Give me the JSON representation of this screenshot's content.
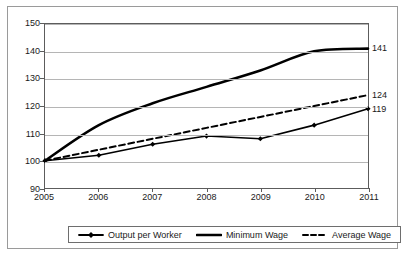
{
  "chart_data": {
    "type": "line",
    "title": "",
    "xlabel": "",
    "ylabel": "",
    "categories": [
      "2005",
      "2006",
      "2007",
      "2008",
      "2009",
      "2010",
      "2011"
    ],
    "x": [
      2005,
      2006,
      2007,
      2008,
      2009,
      2010,
      2011
    ],
    "xlim": [
      2005,
      2011
    ],
    "ylim": [
      90,
      150
    ],
    "ytick_labels": [
      "150",
      "140",
      "130",
      "120",
      "110",
      "100",
      "90"
    ],
    "yticks": [
      150,
      140,
      130,
      120,
      110,
      100,
      90
    ],
    "grid": true,
    "legend_position": "bottom",
    "series": [
      {
        "name": "Output per Worker",
        "style": "solid-with-markers",
        "color": "#000000",
        "marker": "diamond",
        "values": [
          100,
          102,
          106,
          109,
          108,
          113,
          119
        ],
        "end_label": "119"
      },
      {
        "name": "Minimum Wage",
        "style": "solid-thick",
        "color": "#000000",
        "marker": "none",
        "values": [
          100,
          113,
          121,
          127,
          133,
          140,
          141
        ],
        "end_label": "141"
      },
      {
        "name": "Average Wage",
        "style": "dashed",
        "color": "#000000",
        "marker": "none",
        "values": [
          100,
          104,
          108,
          112,
          116,
          120,
          124
        ],
        "end_label": "124"
      }
    ],
    "end_labels": [
      {
        "text": "141",
        "value": 141
      },
      {
        "text": "124",
        "value": 124
      },
      {
        "text": "119",
        "value": 119
      }
    ]
  },
  "legend": {
    "items": [
      {
        "label": "Output per Worker"
      },
      {
        "label": "Minimum Wage"
      },
      {
        "label": "Average Wage"
      }
    ]
  }
}
